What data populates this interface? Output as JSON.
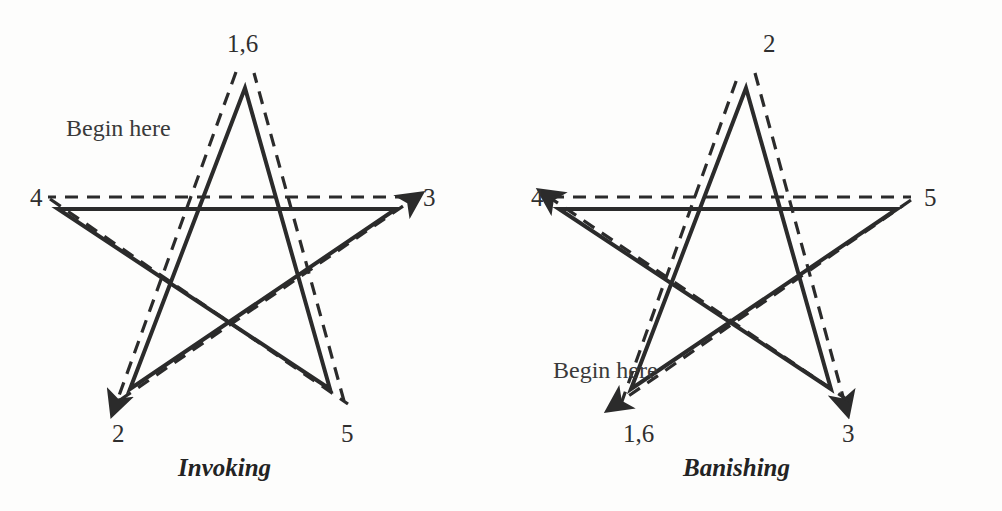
{
  "page": {
    "background_color": "#fdfdfc",
    "ink_color": "#2b2b2b",
    "width": 1002,
    "height": 511
  },
  "figures": [
    {
      "id": "invoking",
      "caption": "Invoking",
      "begin_here": "Begin here",
      "begin_here_pos": {
        "x": 66,
        "y": 116
      },
      "caption_pos": {
        "x": 178,
        "y": 455
      },
      "vertex_labels": [
        {
          "name": "apex",
          "text": "1,6",
          "x": 227,
          "y": 31
        },
        {
          "name": "right",
          "text": "3",
          "x": 423,
          "y": 185
        },
        {
          "name": "bottom-right",
          "text": "5",
          "x": 341,
          "y": 421
        },
        {
          "name": "bottom-left",
          "text": "2",
          "x": 112,
          "y": 421
        },
        {
          "name": "left",
          "text": "4",
          "x": 30,
          "y": 185
        }
      ],
      "sequence": [
        "1",
        "2",
        "3",
        "4",
        "5",
        "6"
      ],
      "start_vertex": "apex",
      "direction": "apex-to-bottom-left"
    },
    {
      "id": "banishing",
      "caption": "Banishing",
      "begin_here": "Begin here",
      "begin_here_pos": {
        "x": 52,
        "y": 358
      },
      "caption_pos": {
        "x": 182,
        "y": 455
      },
      "vertex_labels": [
        {
          "name": "apex",
          "text": "2",
          "x": 262,
          "y": 31
        },
        {
          "name": "right",
          "text": "5",
          "x": 423,
          "y": 185
        },
        {
          "name": "bottom-right",
          "text": "3",
          "x": 341,
          "y": 421
        },
        {
          "name": "bottom-left",
          "text": "1,6",
          "x": 122,
          "y": 421
        },
        {
          "name": "left",
          "text": "4",
          "x": 30,
          "y": 185
        }
      ],
      "sequence": [
        "1",
        "2",
        "3",
        "4",
        "5",
        "6"
      ],
      "start_vertex": "bottom-left",
      "direction": "bottom-left-to-apex"
    }
  ],
  "geometry": {
    "solid_vertices": {
      "apex": {
        "x": 245,
        "y": 88
      },
      "right": {
        "x": 396,
        "y": 209
      },
      "bottom_right": {
        "x": 330,
        "y": 389
      },
      "bottom_left": {
        "x": 130,
        "y": 389
      },
      "left": {
        "x": 58,
        "y": 209
      }
    },
    "dashed_offset_px": 12,
    "solid_stroke_width": 4,
    "dashed_stroke_width": 3.2,
    "dash_pattern": "13 9"
  }
}
